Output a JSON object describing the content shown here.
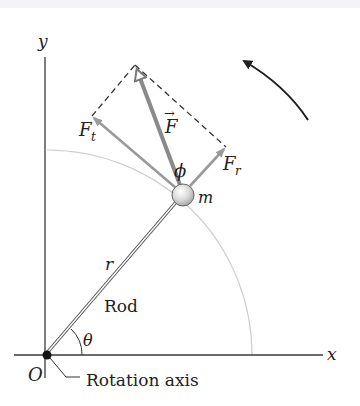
{
  "figure": {
    "type": "physics-diagram",
    "colors": {
      "axis": "#3a3a3a",
      "force": "#8a8a8a",
      "component": "#9a9a9a",
      "arc": "#c8c8c8",
      "dashed": "#333333",
      "rotation_arrow": "#1f1f1f",
      "mass_fill": "#dcdcdc",
      "origin_dot": "#111111"
    }
  },
  "labels": {
    "y_axis": "y",
    "x_axis": "x",
    "origin": "O",
    "rotation_axis": "Rotation axis",
    "rod": "Rod",
    "radius": "r",
    "angle_theta": "θ",
    "angle_phi": "ϕ",
    "mass": "m",
    "force": "F",
    "force_arrow_accent": "→",
    "tangential_force": "F",
    "tangential_subscript": "t",
    "radial_force": "F",
    "radial_subscript": "r"
  },
  "geometry": {
    "origin": [
      47,
      355
    ],
    "mass_center": [
      183,
      195
    ],
    "mass_radius": 11,
    "force_tip": [
      135,
      65
    ],
    "tangential_tip": [
      92,
      116
    ],
    "radial_tip": [
      226,
      147
    ],
    "arc_radius": 205,
    "rotation_arrow": {
      "tail": [
        308,
        120
      ],
      "tip": [
        241,
        58
      ]
    }
  },
  "icons": {
    "rotation": "counterclockwise-arrow-icon"
  }
}
